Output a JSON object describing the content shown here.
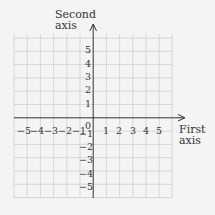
{
  "axes": {
    "x_label_line1": "First",
    "x_label_line2": "axis",
    "y_label_line1": "Second",
    "y_label_line2": "axis"
  },
  "ticks": {
    "x": [
      "−5",
      "−4",
      "−3",
      "−2",
      "−1",
      "1",
      "2",
      "3",
      "4",
      "5"
    ],
    "y_pos": [
      "5",
      "4",
      "3",
      "2",
      "1"
    ],
    "y_neg": [
      "−1",
      "−2",
      "−3",
      "−4",
      "−5"
    ],
    "origin": "0"
  },
  "colors": {
    "background": "#f4f4f4",
    "grid": "#cfcfcf",
    "axis": "#333333"
  }
}
